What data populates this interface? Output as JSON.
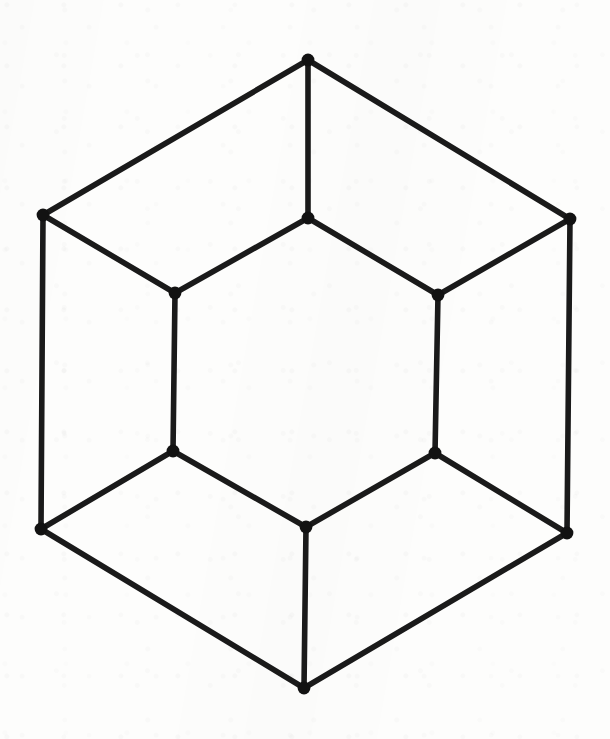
{
  "figure": {
    "canvas": {
      "width": 610,
      "height": 739
    },
    "style": {
      "background_color": "#fdfdfc",
      "edge_color": "#1a1a1a",
      "node_color": "#121212",
      "edge_width": 5.6,
      "node_radius": 6.4
    },
    "counts": {
      "vertices_label": "12 vertices",
      "edges_label": "18 edges",
      "degree_label": "3-regular"
    },
    "vertices": [
      {
        "id": "outer-top",
        "label": "A",
        "x": 308,
        "y": 60,
        "ring": "outer"
      },
      {
        "id": "outer-upper-right",
        "label": "B",
        "x": 570,
        "y": 219,
        "ring": "outer"
      },
      {
        "id": "outer-lower-right",
        "label": "C",
        "x": 567,
        "y": 533,
        "ring": "outer"
      },
      {
        "id": "outer-bottom",
        "label": "D",
        "x": 304,
        "y": 688,
        "ring": "outer"
      },
      {
        "id": "outer-lower-left",
        "label": "E",
        "x": 41,
        "y": 529,
        "ring": "outer"
      },
      {
        "id": "outer-upper-left",
        "label": "F",
        "x": 43,
        "y": 215,
        "ring": "outer"
      },
      {
        "id": "inner-top",
        "label": "a",
        "x": 308,
        "y": 218,
        "ring": "inner"
      },
      {
        "id": "inner-upper-right",
        "label": "b",
        "x": 438,
        "y": 295,
        "ring": "inner"
      },
      {
        "id": "inner-lower-right",
        "label": "c",
        "x": 435,
        "y": 453,
        "ring": "inner"
      },
      {
        "id": "inner-bottom",
        "label": "d",
        "x": 306,
        "y": 527,
        "ring": "inner"
      },
      {
        "id": "inner-lower-left",
        "label": "e",
        "x": 173,
        "y": 451,
        "ring": "inner"
      },
      {
        "id": "inner-upper-left",
        "label": "f",
        "x": 175,
        "y": 293,
        "ring": "inner"
      }
    ],
    "edges": [
      {
        "id": "outer-top__outer-upper-right",
        "from": "outer-top",
        "to": "outer-upper-right",
        "kind": "outer-ring"
      },
      {
        "id": "outer-upper-right__outer-lower-right",
        "from": "outer-upper-right",
        "to": "outer-lower-right",
        "kind": "outer-ring"
      },
      {
        "id": "outer-lower-right__outer-bottom",
        "from": "outer-lower-right",
        "to": "outer-bottom",
        "kind": "outer-ring"
      },
      {
        "id": "outer-bottom__outer-lower-left",
        "from": "outer-bottom",
        "to": "outer-lower-left",
        "kind": "outer-ring"
      },
      {
        "id": "outer-lower-left__outer-upper-left",
        "from": "outer-lower-left",
        "to": "outer-upper-left",
        "kind": "outer-ring"
      },
      {
        "id": "outer-upper-left__outer-top",
        "from": "outer-upper-left",
        "to": "outer-top",
        "kind": "outer-ring"
      },
      {
        "id": "inner-top__inner-upper-right",
        "from": "inner-top",
        "to": "inner-upper-right",
        "kind": "inner-ring"
      },
      {
        "id": "inner-upper-right__inner-lower-right",
        "from": "inner-upper-right",
        "to": "inner-lower-right",
        "kind": "inner-ring"
      },
      {
        "id": "inner-lower-right__inner-bottom",
        "from": "inner-lower-right",
        "to": "inner-bottom",
        "kind": "inner-ring"
      },
      {
        "id": "inner-bottom__inner-lower-left",
        "from": "inner-bottom",
        "to": "inner-lower-left",
        "kind": "inner-ring"
      },
      {
        "id": "inner-lower-left__inner-upper-left",
        "from": "inner-lower-left",
        "to": "inner-upper-left",
        "kind": "inner-ring"
      },
      {
        "id": "inner-upper-left__inner-top",
        "from": "inner-upper-left",
        "to": "inner-top",
        "kind": "inner-ring"
      },
      {
        "id": "outer-top__inner-top",
        "from": "outer-top",
        "to": "inner-top",
        "kind": "spoke"
      },
      {
        "id": "outer-upper-right__inner-upper-right",
        "from": "outer-upper-right",
        "to": "inner-upper-right",
        "kind": "spoke"
      },
      {
        "id": "outer-lower-right__inner-lower-right",
        "from": "outer-lower-right",
        "to": "inner-lower-right",
        "kind": "spoke"
      },
      {
        "id": "outer-bottom__inner-bottom",
        "from": "outer-bottom",
        "to": "inner-bottom",
        "kind": "spoke"
      },
      {
        "id": "outer-lower-left__inner-lower-left",
        "from": "outer-lower-left",
        "to": "inner-lower-left",
        "kind": "spoke"
      },
      {
        "id": "outer-upper-left__inner-upper-left",
        "from": "outer-upper-left",
        "to": "inner-upper-left",
        "kind": "spoke"
      }
    ]
  }
}
